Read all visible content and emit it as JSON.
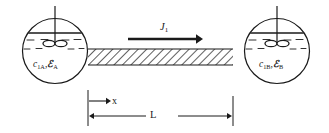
{
  "figure": {
    "stroke_color": "#1a1a1a",
    "hatch_color": "#2b2b2b",
    "background": "#ffffff"
  },
  "vessels": {
    "left": {
      "name": "vessel-A",
      "label_species": "c",
      "label_species_sub": "1A",
      "label_energy": "ℰ",
      "label_energy_sub": "A",
      "separator": ",",
      "cx": 55,
      "cy": 51,
      "r": 33
    },
    "right": {
      "name": "vessel-B",
      "label_species": "c",
      "label_species_sub": "1B",
      "label_energy": "ℰ",
      "label_energy_sub": "B",
      "separator": ",",
      "cx": 277,
      "cy": 51,
      "r": 33
    }
  },
  "flux": {
    "symbol": "J",
    "subscript": "1",
    "direction": "left-to-right",
    "arrow_x_start": 128,
    "arrow_x_end": 202,
    "arrow_y": 39
  },
  "tube": {
    "name": "capillary-tube",
    "x_start": 88,
    "x_end": 233,
    "y_top": 49,
    "y_bottom": 65,
    "hatching": "45-degree"
  },
  "dimensions": {
    "x_label": "x",
    "x_arrow_start": 90,
    "x_arrow_end": 110,
    "x_arrow_y": 101,
    "length_label": "L",
    "length_start": 88,
    "length_end": 233,
    "length_y": 116,
    "tick_top": 90,
    "tick_bottom": 126
  }
}
